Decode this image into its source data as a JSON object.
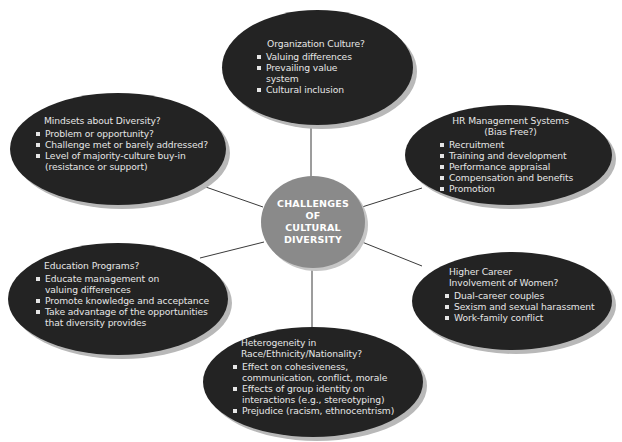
{
  "diagram": {
    "type": "hub-and-spoke",
    "center": {
      "label": "CHALLENGES\nOF\nCULTURAL\nDIVERSITY"
    },
    "nodes": [
      {
        "id": "organization-culture",
        "title": "Organization Culture?",
        "items": [
          "Valuing differences",
          "Prevailing value\nsystem",
          "Cultural inclusion"
        ]
      },
      {
        "id": "hr-management-systems",
        "title": "HR Management Systems\n(Bias Free?)",
        "items": [
          "Recruitment",
          "Training and development",
          "Performance appraisal",
          "Compensation and benefits",
          "Promotion"
        ]
      },
      {
        "id": "higher-career-involvement-women",
        "title": "Higher Career\nInvolvement of Women?",
        "items": [
          "Dual-career couples",
          "Sexism and sexual harassment",
          "Work-family conflict"
        ]
      },
      {
        "id": "heterogeneity",
        "title": "Heterogeneity in\nRace/Ethnicity/Nationality?",
        "items": [
          "Effect on cohesiveness,\ncommunication, conflict, morale",
          "Effects of group identity on\ninteractions (e.g., stereotyping)",
          "Prejudice (racism, ethnocentrism)"
        ]
      },
      {
        "id": "education-programs",
        "title": "Education Programs?",
        "items": [
          "Educate management on\nvaluing differences",
          "Promote knowledge and acceptance",
          "Take advantage of the opportunities\nthat diversity provides"
        ]
      },
      {
        "id": "mindsets-about-diversity",
        "title": "Mindsets about Diversity?",
        "items": [
          "Problem or opportunity?",
          "Challenge met or barely addressed?",
          "Level of majority-culture buy-in\n(resistance or support)"
        ]
      }
    ],
    "colors": {
      "node_fill": "#232323",
      "node_text": "#e6e6e6",
      "center_fill": "#8a8a8a",
      "center_text": "#ffffff",
      "shadow": "#b8b8b8",
      "connector": "#3a3a3a"
    }
  }
}
